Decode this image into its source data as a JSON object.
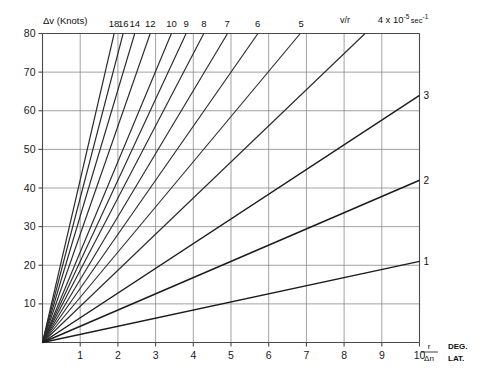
{
  "chart_data": {
    "type": "line",
    "title": "",
    "ylabel": "Δv (Knots)",
    "xlabel_symbol_top": "r",
    "xlabel_symbol_bottom": "Δn",
    "xlabel_unit_top": "DEG.",
    "xlabel_unit_bottom": "LAT.",
    "xlim": [
      0,
      10
    ],
    "ylim": [
      0,
      80
    ],
    "x_ticks": [
      "1",
      "2",
      "3",
      "4",
      "5",
      "6",
      "7",
      "8",
      "9",
      "10"
    ],
    "x_tick_values": [
      1,
      2,
      3,
      4,
      5,
      6,
      7,
      8,
      9,
      10
    ],
    "y_ticks": [
      "10",
      "20",
      "30",
      "40",
      "50",
      "60",
      "70",
      "80"
    ],
    "y_tick_values": [
      10,
      20,
      30,
      40,
      50,
      60,
      70,
      80
    ],
    "grid": true,
    "grid_x": [
      1,
      2,
      3,
      4,
      5,
      6,
      7,
      8,
      9,
      10
    ],
    "grid_y": [
      10,
      20,
      30,
      40,
      50,
      60,
      70,
      80
    ],
    "legend": "none",
    "annotation_vr": "v/r",
    "annotation_units_prefix": "4 x 10",
    "annotation_units_sup": "-5",
    "annotation_units_suffix": "sec",
    "annotation_units_sup2": "-1",
    "series_note": "Fan of straight lines through the origin; slope = Δv/Δn in knots per degree latitude. Top labels mark the line where it leaves the top edge (Δv = 80); right labels mark the line where it leaves the right edge (Δn = 10).",
    "series": [
      {
        "name": "18",
        "label": "18",
        "slope": 42.1,
        "label_edge": "top",
        "x_at_top": 1.9,
        "y_at_right": 80
      },
      {
        "name": "16",
        "label": "16",
        "slope": 37.4,
        "label_edge": "top",
        "x_at_top": 2.14,
        "y_at_right": 80
      },
      {
        "name": "14",
        "label": "14",
        "slope": 32.7,
        "label_edge": "top",
        "x_at_top": 2.45,
        "y_at_right": 80
      },
      {
        "name": "12",
        "label": "12",
        "slope": 28.0,
        "label_edge": "top",
        "x_at_top": 2.86,
        "y_at_right": 80
      },
      {
        "name": "10",
        "label": "10",
        "slope": 23.4,
        "label_edge": "top",
        "x_at_top": 3.42,
        "y_at_right": 80
      },
      {
        "name": "9",
        "label": "9",
        "slope": 21.0,
        "label_edge": "top",
        "x_at_top": 3.81,
        "y_at_right": 80
      },
      {
        "name": "8",
        "label": "8",
        "slope": 18.7,
        "label_edge": "top",
        "x_at_top": 4.28,
        "y_at_right": 80
      },
      {
        "name": "7",
        "label": "7",
        "slope": 16.3,
        "label_edge": "top",
        "x_at_top": 4.9,
        "y_at_right": 80
      },
      {
        "name": "6",
        "label": "6",
        "slope": 14.0,
        "label_edge": "top",
        "x_at_top": 5.71,
        "y_at_right": 80
      },
      {
        "name": "5",
        "label": "5",
        "slope": 11.7,
        "label_edge": "top",
        "x_at_top": 6.86,
        "y_at_right": 80
      },
      {
        "name": "4",
        "label": "",
        "slope": 9.35,
        "label_edge": "top",
        "x_at_top": 8.56,
        "y_at_right": 80
      },
      {
        "name": "3",
        "label": "3",
        "slope": 6.4,
        "label_edge": "right",
        "x_at_top": 10,
        "y_at_right": 64
      },
      {
        "name": "2",
        "label": "2",
        "slope": 4.2,
        "label_edge": "right",
        "x_at_top": 10,
        "y_at_right": 42
      },
      {
        "name": "1",
        "label": "1",
        "slope": 2.1,
        "label_edge": "right",
        "x_at_top": 10,
        "y_at_right": 21
      }
    ]
  },
  "top_labels": [
    "18",
    "16",
    "14",
    "12",
    "10",
    "9",
    "8",
    "7",
    "6",
    "5"
  ],
  "right_labels": [
    "3",
    "2",
    "1"
  ],
  "colors": {
    "background": "#ffffff",
    "axis": "#4a4a4a",
    "grid": "#8a8a8a",
    "line": "#2a2a2a",
    "text": "#111111"
  }
}
